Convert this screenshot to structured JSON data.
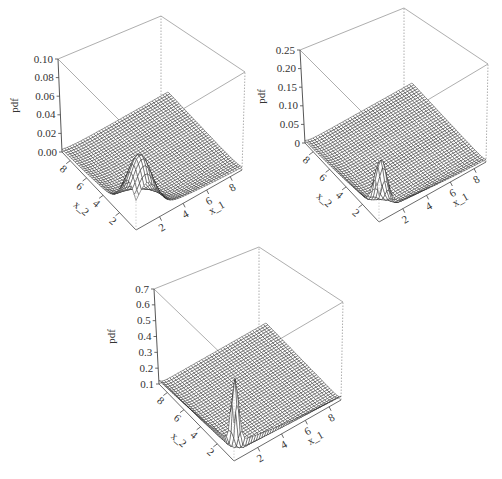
{
  "chart_data": [
    {
      "type": "surface3d",
      "title": "",
      "xlabel": "x_1",
      "ylabel": "x_2",
      "zlabel": "pdf",
      "x_ticks": [
        "2",
        "4",
        "6",
        "8"
      ],
      "y_ticks": [
        "2",
        "4",
        "6",
        "8"
      ],
      "z_ticks": [
        "0.00",
        "0.02",
        "0.04",
        "0.06",
        "0.08",
        "0.10"
      ],
      "zlim": [
        0,
        0.1
      ],
      "xlim": [
        0,
        9
      ],
      "ylim": [
        0,
        9
      ],
      "peak": {
        "x1": 1.0,
        "x2": 1.0,
        "z": 0.04
      },
      "description": "Wireframe of bivariate pdf, broad ridge along low x_1 and x_2 axes with peak about 0.04",
      "box": {
        "tl": [
          58,
          59
        ],
        "tb": [
          161,
          16
        ],
        "tr": [
          245,
          72
        ],
        "bl": [
          62,
          152
        ],
        "bb": [
          161,
          104
        ],
        "br": [
          242,
          170
        ],
        "bf": [
          136,
          230
        ]
      },
      "spread": 1.1,
      "peak_px": 58
    },
    {
      "type": "surface3d",
      "title": "",
      "xlabel": "x_1",
      "ylabel": "x_2",
      "zlabel": "pdf",
      "x_ticks": [
        "2",
        "4",
        "6",
        "8"
      ],
      "y_ticks": [
        "2",
        "4",
        "6",
        "8"
      ],
      "z_ticks": [
        "0",
        "0.05",
        "0.10",
        "0.15",
        "0.20",
        "0.25"
      ],
      "zlim": [
        0,
        0.25
      ],
      "xlim": [
        0,
        9
      ],
      "ylim": [
        0,
        9
      ],
      "peak": {
        "x1": 0.6,
        "x2": 0.6,
        "z": 0.1
      },
      "description": "Wireframe of bivariate pdf, sharper ridge near origin with peak about 0.10",
      "box": {
        "tl": [
          300,
          50
        ],
        "tb": [
          404,
          8
        ],
        "tr": [
          488,
          64
        ],
        "bl": [
          305,
          143
        ],
        "bb": [
          404,
          97
        ],
        "br": [
          486,
          162
        ],
        "bf": [
          379,
          222
        ]
      },
      "spread": 0.55,
      "peak_px": 52
    },
    {
      "type": "surface3d",
      "title": "",
      "xlabel": "x_1",
      "ylabel": "x_2",
      "zlabel": "pdf",
      "x_ticks": [
        "2",
        "4",
        "6",
        "8"
      ],
      "y_ticks": [
        "2",
        "4",
        "6",
        "8"
      ],
      "z_ticks": [
        "0.1",
        "0.2",
        "0.3",
        "0.4",
        "0.5",
        "0.6",
        "0.7"
      ],
      "zlim": [
        0.1,
        0.75
      ],
      "xlim": [
        0,
        9
      ],
      "ylim": [
        0,
        9
      ],
      "peak": {
        "x1": 0.3,
        "x2": 0.3,
        "z": 0.35
      },
      "description": "Wireframe of bivariate pdf, very sharp spike near origin with peak about 0.35",
      "box": {
        "tl": [
          154,
          289
        ],
        "tb": [
          259,
          247
        ],
        "tr": [
          343,
          302
        ],
        "bl": [
          159,
          384
        ],
        "bb": [
          259,
          334
        ],
        "br": [
          341,
          400
        ],
        "bf": [
          234,
          461
        ]
      },
      "spread": 0.3,
      "peak_px": 75
    }
  ]
}
